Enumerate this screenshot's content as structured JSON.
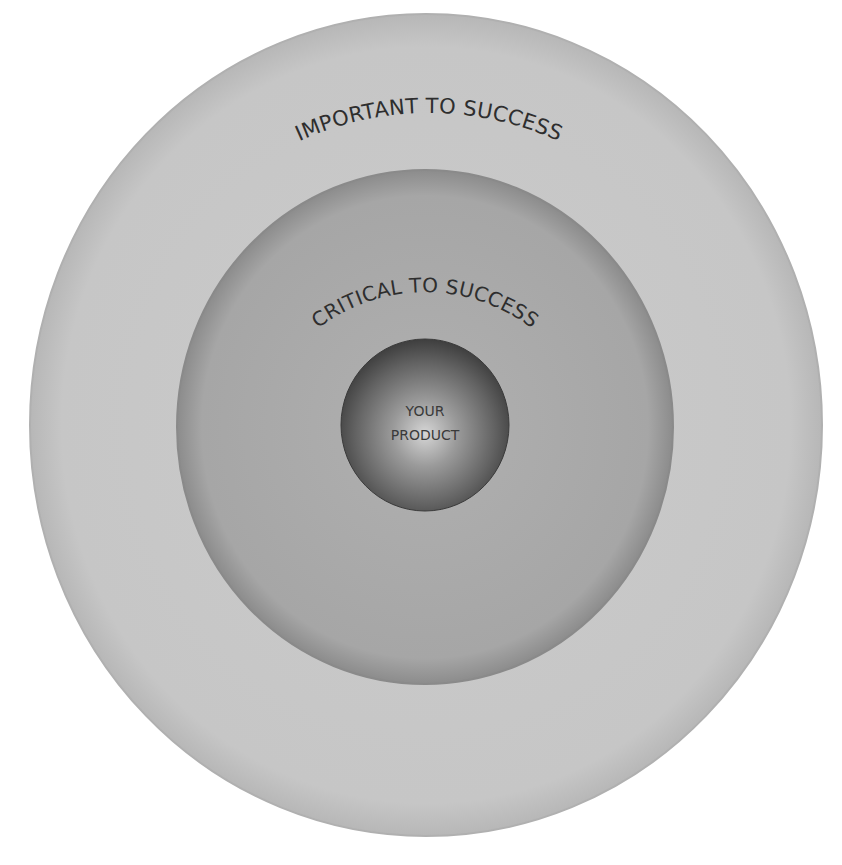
{
  "diagram": {
    "type": "concentric-circles",
    "rings": [
      {
        "id": "outer",
        "label": "IMPORTANT TO SUCCESS",
        "fill": "#c6c6c6",
        "edge": "#b4b4b4"
      },
      {
        "id": "middle",
        "label": "CRITICAL TO SUCCESS",
        "fill": "#a9a9a9",
        "edge": "#8e8e8e"
      },
      {
        "id": "inner",
        "label_line1": "YOUR",
        "label_line2": "PRODUCT",
        "fill_center": "#d4d4d4",
        "fill_edge": "#4a4a4a"
      }
    ]
  }
}
